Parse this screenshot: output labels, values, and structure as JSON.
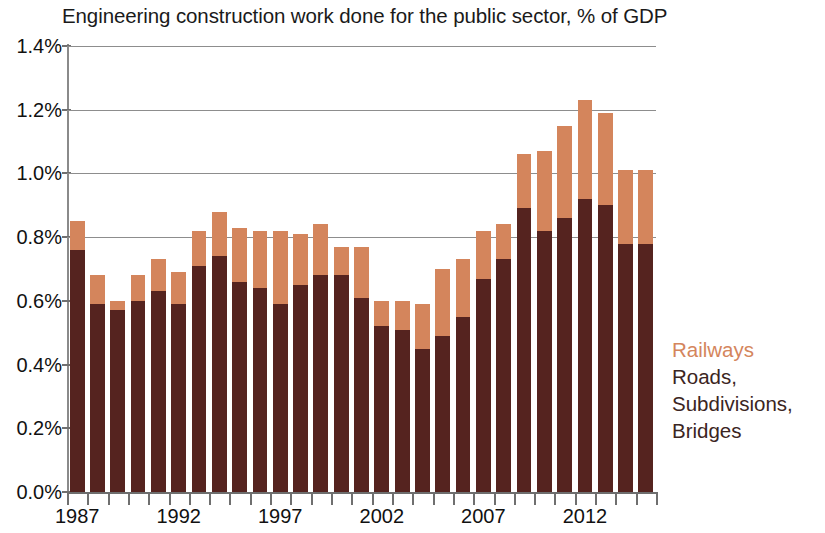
{
  "chart_data": {
    "type": "bar",
    "subtype": "stacked-bar",
    "title": "Engineering construction work done for the public sector, % of GDP",
    "xlabel": "",
    "ylabel": "",
    "ylim": [
      0,
      1.4
    ],
    "ytick_labels": [
      "0.0%",
      "0.2%",
      "0.4%",
      "0.6%",
      "0.8%",
      "1.0%",
      "1.2%",
      "1.4%"
    ],
    "ytick_values": [
      0.0,
      0.2,
      0.4,
      0.6,
      0.8,
      1.0,
      1.2,
      1.4
    ],
    "grid": "horizontal",
    "legend_position": "right",
    "categories": [
      "1987",
      "1988",
      "1989",
      "1990",
      "1991",
      "1992",
      "1993",
      "1994",
      "1995",
      "1996",
      "1997",
      "1998",
      "1999",
      "2000",
      "2001",
      "2002",
      "2003",
      "2004",
      "2005",
      "2006",
      "2007",
      "2008",
      "2009",
      "2010",
      "2011",
      "2012",
      "2013",
      "2014",
      "2015"
    ],
    "xtick_labels": [
      "1987",
      "1992",
      "1997",
      "2002",
      "2007",
      "2012"
    ],
    "xtick_indices": [
      0,
      5,
      10,
      15,
      20,
      25
    ],
    "series": [
      {
        "name": "Roads, Subdivisions, Bridges",
        "color": "#55231F",
        "values": [
          0.76,
          0.59,
          0.57,
          0.6,
          0.63,
          0.59,
          0.71,
          0.74,
          0.66,
          0.64,
          0.59,
          0.65,
          0.68,
          0.68,
          0.61,
          0.52,
          0.51,
          0.45,
          0.49,
          0.55,
          0.67,
          0.73,
          0.89,
          0.82,
          0.86,
          0.92,
          0.9,
          0.78,
          0.78
        ]
      },
      {
        "name": "Railways",
        "color": "#D4855C",
        "values": [
          0.09,
          0.09,
          0.03,
          0.08,
          0.1,
          0.1,
          0.11,
          0.14,
          0.17,
          0.18,
          0.23,
          0.16,
          0.16,
          0.09,
          0.16,
          0.08,
          0.09,
          0.14,
          0.21,
          0.18,
          0.15,
          0.11,
          0.17,
          0.25,
          0.29,
          0.31,
          0.29,
          0.23,
          0.23
        ]
      }
    ],
    "totals": [
      0.85,
      0.68,
      0.6,
      0.68,
      0.73,
      0.69,
      0.82,
      0.88,
      0.83,
      0.82,
      0.82,
      0.81,
      0.84,
      0.77,
      0.77,
      0.6,
      0.6,
      0.59,
      0.7,
      0.73,
      0.82,
      0.84,
      1.06,
      1.07,
      1.15,
      1.23,
      1.19,
      1.01,
      1.01
    ]
  },
  "legend": {
    "railways_label": "Railways",
    "roads_line1": "Roads,",
    "roads_line2": "Subdivisions,",
    "roads_line3": "Bridges"
  },
  "colors": {
    "railways": "#D4855C",
    "roads": "#55231F",
    "gridline": "#8D8D8D",
    "text": "#111111",
    "background": "#FFFFFF"
  }
}
